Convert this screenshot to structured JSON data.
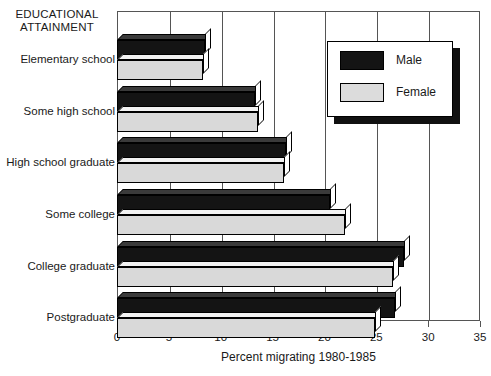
{
  "chart_data": {
    "type": "bar",
    "orientation": "horizontal",
    "title": "",
    "ylabel": "EDUCATIONAL ATTAINMENT",
    "xlabel": "Percent migrating 1980-1985",
    "xlim": [
      0,
      35
    ],
    "xticks": [
      0,
      5,
      10,
      15,
      20,
      25,
      30,
      35
    ],
    "xtick_labels": [
      "0",
      "5",
      "10",
      "15",
      "20",
      "25",
      "30",
      "35"
    ],
    "grid": true,
    "grid_axis": "x",
    "legend_position": "top-right",
    "categories": [
      "Elementary school",
      "Some high school",
      "High school graduate",
      "Some college",
      "College graduate",
      "Postgraduate"
    ],
    "series": [
      {
        "name": "Male",
        "color": "#141414",
        "values": [
          8.5,
          13.3,
          16.3,
          20.5,
          27.7,
          26.8
        ]
      },
      {
        "name": "Female",
        "color": "#d9d9d9",
        "values": [
          8.3,
          13.6,
          16.1,
          22.0,
          26.6,
          24.9
        ]
      }
    ]
  },
  "axis_title": {
    "line1": "EDUCATIONAL",
    "line2": "ATTAINMENT"
  },
  "legend": {
    "items": [
      {
        "label": "Male",
        "swatch": "male-swatch"
      },
      {
        "label": "Female",
        "swatch": "female-swatch"
      }
    ]
  }
}
